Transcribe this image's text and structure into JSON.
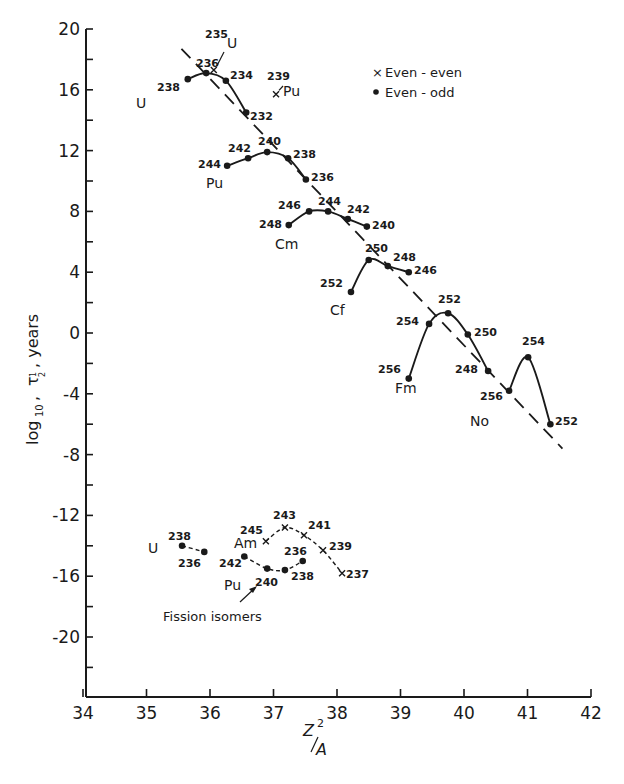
{
  "chart_data": {
    "type": "line",
    "title": "",
    "xlabel": "Z^2/A",
    "ylabel": "log10 τ1/2, years",
    "xlim": [
      34,
      42
    ],
    "ylim": [
      -24,
      20
    ],
    "xticks": [
      34,
      35,
      36,
      37,
      38,
      39,
      40,
      41,
      42
    ],
    "yticks": [
      20,
      16,
      12,
      8,
      4,
      0,
      -4,
      -8,
      -12,
      -16,
      -20
    ],
    "grid": false,
    "legend": {
      "position": "upper right",
      "entries": [
        {
          "marker": "x",
          "label": "Even - even"
        },
        {
          "marker": "dot",
          "label": "Even - odd"
        }
      ]
    },
    "trend_line": {
      "style": "dashed",
      "x": [
        35.55,
        41.55
      ],
      "y": [
        18.7,
        -7.6
      ]
    },
    "series": [
      {
        "name": "U",
        "marker": "dot",
        "line": "solid",
        "mass": [
          "238",
          "236",
          "234",
          "232"
        ],
        "x": [
          35.65,
          35.94,
          36.25,
          36.57
        ],
        "y": [
          16.7,
          17.1,
          16.6,
          14.5
        ]
      },
      {
        "name": "Pu",
        "marker": "dot",
        "line": "solid",
        "mass": [
          "244",
          "242",
          "240",
          "238",
          "236"
        ],
        "x": [
          36.27,
          36.6,
          36.9,
          37.23,
          37.51
        ],
        "y": [
          11.0,
          11.5,
          11.9,
          11.5,
          10.1
        ]
      },
      {
        "name": "Cm",
        "marker": "dot",
        "line": "solid",
        "mass": [
          "248",
          "246",
          "244",
          "242",
          "240"
        ],
        "x": [
          37.24,
          37.56,
          37.86,
          38.17,
          38.47
        ],
        "y": [
          7.1,
          8.0,
          8.0,
          7.5,
          7.0
        ]
      },
      {
        "name": "Cf",
        "marker": "dot",
        "line": "solid",
        "mass": [
          "252",
          "250",
          "248",
          "246"
        ],
        "x": [
          38.22,
          38.5,
          38.8,
          39.13
        ],
        "y": [
          2.7,
          4.8,
          4.4,
          4.0
        ]
      },
      {
        "name": "Fm",
        "marker": "dot",
        "line": "solid",
        "mass": [
          "256",
          "254",
          "252",
          "250",
          "248"
        ],
        "x": [
          39.13,
          39.45,
          39.75,
          40.06,
          40.38
        ],
        "y": [
          -3.0,
          0.6,
          1.3,
          -0.1,
          -2.5
        ]
      },
      {
        "name": "No",
        "marker": "dot",
        "line": "solid",
        "mass": [
          "256",
          "254",
          "252"
        ],
        "x": [
          40.71,
          41.01,
          41.36
        ],
        "y": [
          -3.8,
          -1.6,
          -6.0
        ]
      },
      {
        "name": "235U",
        "marker": "x",
        "line": "none",
        "mass": [
          "235"
        ],
        "x": [
          36.06
        ],
        "y": [
          17.3
        ]
      },
      {
        "name": "239Pu",
        "marker": "x",
        "line": "none",
        "mass": [
          "239"
        ],
        "x": [
          37.04
        ],
        "y": [
          15.7
        ]
      },
      {
        "name": "U (fission isomers)",
        "marker": "dot",
        "line": "dashed",
        "mass": [
          "238",
          "236"
        ],
        "x": [
          35.56,
          35.91
        ],
        "y": [
          -14.0,
          -14.4
        ]
      },
      {
        "name": "Pu (fission isomers)",
        "marker": "dot",
        "line": "dashed",
        "mass": [
          "242",
          "240",
          "238",
          "236"
        ],
        "x": [
          36.54,
          36.9,
          37.18,
          37.46
        ],
        "y": [
          -14.7,
          -15.5,
          -15.6,
          -15.0
        ]
      },
      {
        "name": "Am (fission isomers)",
        "marker": "x",
        "line": "dashed",
        "mass": [
          "245",
          "243",
          "241",
          "239",
          "237"
        ],
        "x": [
          36.88,
          37.18,
          37.48,
          37.78,
          38.08
        ],
        "y": [
          -13.7,
          -12.8,
          -13.3,
          -14.3,
          -15.8
        ]
      }
    ],
    "annotations": [
      {
        "text": "Fission isomers",
        "arrow_to": "Pu 240 fission isomer"
      }
    ]
  },
  "plot": {
    "px_x0": 83,
    "px_per_x": 63.5,
    "px_y_at_20": 29,
    "px_per_y": 15.2,
    "axis_left_px": 86,
    "axis_bottom_px": 697,
    "axis_right_px": 591
  },
  "labels": {
    "element_labels": [
      {
        "text": "U",
        "x": 136,
        "y": 108
      },
      {
        "text": "U",
        "x": 227,
        "y": 48
      },
      {
        "text": "Pu",
        "x": 283,
        "y": 96
      },
      {
        "text": "Pu",
        "x": 206,
        "y": 188
      },
      {
        "text": "Cm",
        "x": 275,
        "y": 249
      },
      {
        "text": "Cf",
        "x": 330,
        "y": 315
      },
      {
        "text": "Fm",
        "x": 395,
        "y": 393
      },
      {
        "text": "No",
        "x": 470,
        "y": 426
      },
      {
        "text": "U",
        "x": 148,
        "y": 553
      },
      {
        "text": "Am",
        "x": 234,
        "y": 548
      },
      {
        "text": "Pu",
        "x": 224,
        "y": 590
      }
    ],
    "point_labels": [
      {
        "text": "238",
        "x": 157,
        "y": 91
      },
      {
        "text": "236",
        "x": 196,
        "y": 67
      },
      {
        "text": "235",
        "x": 205,
        "y": 38
      },
      {
        "text": "234",
        "x": 230,
        "y": 79
      },
      {
        "text": "232",
        "x": 250,
        "y": 120
      },
      {
        "text": "239",
        "x": 267,
        "y": 80
      },
      {
        "text": "244",
        "x": 198,
        "y": 168
      },
      {
        "text": "242",
        "x": 228,
        "y": 152
      },
      {
        "text": "240",
        "x": 258,
        "y": 145
      },
      {
        "text": "238",
        "x": 293,
        "y": 158
      },
      {
        "text": "236",
        "x": 311,
        "y": 181
      },
      {
        "text": "248",
        "x": 259,
        "y": 228
      },
      {
        "text": "246",
        "x": 278,
        "y": 209
      },
      {
        "text": "244",
        "x": 318,
        "y": 205
      },
      {
        "text": "242",
        "x": 347,
        "y": 213
      },
      {
        "text": "240",
        "x": 372,
        "y": 229
      },
      {
        "text": "250",
        "x": 365,
        "y": 252
      },
      {
        "text": "248",
        "x": 393,
        "y": 261
      },
      {
        "text": "246",
        "x": 414,
        "y": 274
      },
      {
        "text": "252",
        "x": 320,
        "y": 287
      },
      {
        "text": "254",
        "x": 396,
        "y": 325
      },
      {
        "text": "252",
        "x": 438,
        "y": 303
      },
      {
        "text": "250",
        "x": 474,
        "y": 336
      },
      {
        "text": "248",
        "x": 455,
        "y": 373
      },
      {
        "text": "256",
        "x": 378,
        "y": 373
      },
      {
        "text": "254",
        "x": 522,
        "y": 345
      },
      {
        "text": "256",
        "x": 480,
        "y": 400
      },
      {
        "text": "252",
        "x": 555,
        "y": 425
      },
      {
        "text": "238",
        "x": 168,
        "y": 540
      },
      {
        "text": "236",
        "x": 178,
        "y": 567
      },
      {
        "text": "245",
        "x": 240,
        "y": 534
      },
      {
        "text": "243",
        "x": 273,
        "y": 519
      },
      {
        "text": "241",
        "x": 308,
        "y": 529
      },
      {
        "text": "239",
        "x": 329,
        "y": 550
      },
      {
        "text": "237",
        "x": 346,
        "y": 578
      },
      {
        "text": "242",
        "x": 219,
        "y": 567
      },
      {
        "text": "236",
        "x": 284,
        "y": 555
      },
      {
        "text": "238",
        "x": 291,
        "y": 580
      },
      {
        "text": "240",
        "x": 255,
        "y": 586
      }
    ],
    "fission_isomers_label": {
      "text": "Fission isomers",
      "x": 163,
      "y": 621
    }
  },
  "axes": {
    "y_title_parts": {
      "log": "log",
      "sub10": "10",
      "tau": "τ",
      "half_num": "1",
      "half_den": "2",
      "years": ", years"
    },
    "x_title": {
      "z": "Z",
      "sup": "2",
      "a": "A"
    }
  }
}
